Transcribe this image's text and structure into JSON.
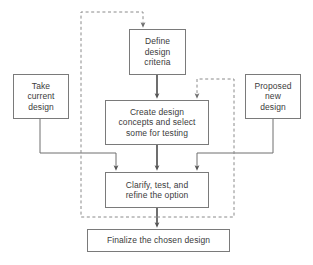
{
  "diagram": {
    "colors": {
      "box_border": "#7a7a7a",
      "box_fill": "#ffffff",
      "text": "#3b3b3b",
      "solid_connector": "#555555",
      "dashed_connector": "#8a8a8a",
      "background": "#ffffff"
    },
    "nodes": [
      {
        "id": "define-design-criteria",
        "label": "Define\ndesign\ncriteria",
        "lines": [
          "Define",
          "design",
          "criteria"
        ],
        "x": 129,
        "y": 29,
        "w": 57,
        "h": 46
      },
      {
        "id": "take-current-design",
        "label": "Take\ncurrent\ndesign",
        "lines": [
          "Take",
          "current",
          "design"
        ],
        "x": 13,
        "y": 74,
        "w": 56,
        "h": 45
      },
      {
        "id": "proposed-new-design",
        "label": "Proposed\nnew\ndesign",
        "lines": [
          "Proposed",
          "new",
          "design"
        ],
        "x": 245,
        "y": 74,
        "w": 56,
        "h": 45
      },
      {
        "id": "create-design-concepts",
        "label": "Create design\nconcepts and select\nsome for testing",
        "lines": [
          "Create design",
          "concepts and select",
          "some for testing"
        ],
        "x": 105,
        "y": 100,
        "w": 104,
        "h": 45
      },
      {
        "id": "clarify-test-refine",
        "label": "Clarify, test, and\nrefine the option",
        "lines": [
          "Clarify, test, and",
          "refine the option"
        ],
        "x": 105,
        "y": 172,
        "w": 104,
        "h": 36
      },
      {
        "id": "finalize-chosen-design",
        "label": "Finalize the chosen design",
        "lines": [
          "Finalize the chosen design"
        ],
        "x": 87,
        "y": 229,
        "w": 143,
        "h": 23
      }
    ],
    "connectors": [
      {
        "id": "define-to-create",
        "style": "solid",
        "from": "define-design-criteria",
        "to": "create-design-concepts",
        "arrow": true
      },
      {
        "id": "create-to-clarify",
        "style": "solid",
        "from": "create-design-concepts",
        "to": "clarify-test-refine",
        "arrow": true
      },
      {
        "id": "clarify-to-finalize",
        "style": "solid",
        "from": "clarify-test-refine",
        "to": "finalize-chosen-design",
        "arrow": true
      },
      {
        "id": "take-current-to-clarify",
        "style": "solid",
        "from": "take-current-design",
        "to": "clarify-test-refine",
        "arrow": true
      },
      {
        "id": "proposed-new-to-clarify",
        "style": "solid",
        "from": "proposed-new-design",
        "to": "clarify-test-refine",
        "arrow": true
      },
      {
        "id": "outer-feedback-loop",
        "style": "dashed",
        "from": "clarify-to-finalize-line",
        "to": "define-design-criteria",
        "arrow": true
      },
      {
        "id": "inner-feedback-loop",
        "style": "dashed",
        "from": "clarify-to-finalize-line",
        "to": "create-design-concepts",
        "arrow": true
      }
    ]
  }
}
